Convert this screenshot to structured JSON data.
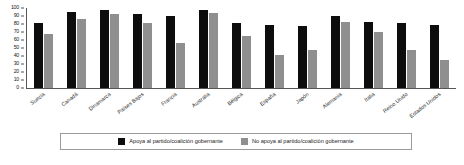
{
  "chart_data": {
    "type": "bar",
    "title": "",
    "subtitle": "",
    "xlabel": "",
    "ylabel": "",
    "ylim": [
      0,
      100
    ],
    "yticks": [
      100,
      90,
      80,
      70,
      60,
      50,
      40,
      30,
      20,
      10,
      0
    ],
    "grid": false,
    "legend_position": "bottom",
    "categories": [
      "Suecia",
      "Canadá",
      "Dinamarca",
      "Países Bajos",
      "Francia",
      "Australia",
      "Bélgica",
      "España",
      "Japón",
      "Alemania",
      "Italia",
      "Reino Unido",
      "Estados Unidos"
    ],
    "series": [
      {
        "name": "Apoya al partido/coalición gobernante",
        "color": "#0d0d0d",
        "values": [
          81,
          95,
          97,
          93,
          90,
          98,
          81,
          79,
          78,
          90,
          82,
          81,
          79
        ]
      },
      {
        "name": "No apoya al partido/coalición gobernante",
        "color": "#8f8f8f",
        "values": [
          68,
          86,
          92,
          81,
          56,
          94,
          65,
          41,
          47,
          83,
          70,
          48,
          35
        ]
      }
    ]
  }
}
